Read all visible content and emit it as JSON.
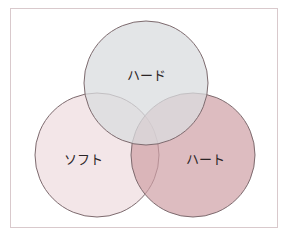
{
  "diagram": {
    "type": "venn",
    "sets": [
      {
        "id": "hard",
        "label": "ハード",
        "cx": 146,
        "cy": 83,
        "r": 62,
        "fill": "#d9dcdf",
        "opacity": 0.75
      },
      {
        "id": "soft",
        "label": "ソフト",
        "cx": 97,
        "cy": 155,
        "r": 62,
        "fill": "#efdde0",
        "opacity": 0.75
      },
      {
        "id": "heart",
        "label": "ハート",
        "cx": 193,
        "cy": 155,
        "r": 62,
        "fill": "#cf9fa5",
        "opacity": 0.7
      }
    ],
    "stroke": "#7d6a6e",
    "frame_border": "#d9c9cc"
  }
}
